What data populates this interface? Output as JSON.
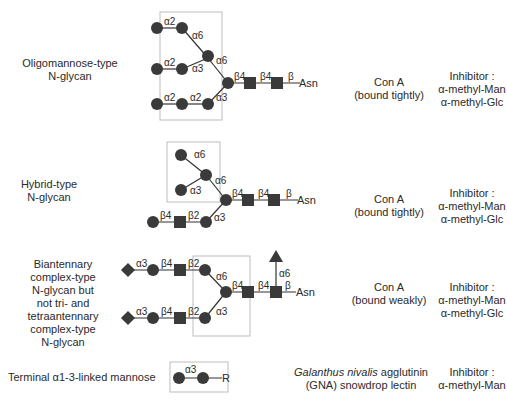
{
  "rows": [
    {
      "name": "oligomannose",
      "glycan_label": [
        "Oligomannose-type",
        "N-glycan"
      ],
      "lectin": [
        "Con A",
        "(bound tightly)"
      ],
      "inhibitor": [
        "Inhibitor :",
        "α-methyl-Man",
        "α-methyl-Glc"
      ],
      "linkages": {
        "a2_top": "α2",
        "a6_top": "α6",
        "a2_mid": "α2",
        "a3_mid": "α3",
        "a6_core": "α6",
        "a2_bot1": "α2",
        "a2_bot2": "α2",
        "a3_core": "α3",
        "b4_1": "β4",
        "b4_2": "β4",
        "b": "β",
        "asn": "Asn"
      }
    },
    {
      "name": "hybrid",
      "glycan_label": [
        "Hybrid-type",
        "N-glycan"
      ],
      "lectin": [
        "Con A",
        "(bound tightly)"
      ],
      "inhibitor": [
        "Inhibitor :",
        "α-methyl-Man",
        "α-methyl-Glc"
      ],
      "linkages": {
        "a6_top": "α6",
        "a3_top": "α3",
        "a6_core": "α6",
        "b4_branch": "β4",
        "b2_branch": "β2",
        "a3_core": "α3",
        "b4_1": "β4",
        "b4_2": "β4",
        "b": "β",
        "asn": "Asn"
      }
    },
    {
      "name": "biantennary",
      "glycan_label": [
        "Biantennary",
        "complex-type",
        "N-glycan but",
        "not tri- and",
        "tetraantennary",
        "complex-type",
        "N-glycan"
      ],
      "lectin": [
        "Con A",
        "(bound weakly)"
      ],
      "inhibitor": [
        "Inhibitor :",
        "α-methyl-Man",
        "α-methyl-Glc"
      ],
      "linkages": {
        "a3_top": "α3",
        "b4_top": "β4",
        "b2_top": "β2",
        "a6_core": "α6",
        "a3_bot": "α3",
        "b4_bot": "β4",
        "b2_bot": "β2",
        "a3_core": "α3",
        "b4_1": "β4",
        "b4_2": "β4",
        "a6_fuc": "α6",
        "b": "β",
        "asn": "Asn"
      }
    },
    {
      "name": "terminal-mannose",
      "glycan_label": [
        "Terminal α1-3-linked mannose"
      ],
      "lectin_italic": "Galanthus nivalis",
      "lectin_rest": " agglutinin",
      "lectin_line2": "(GNA) snowdrop lectin",
      "inhibitor": [
        "Inhibitor :",
        "α-methyl-Man"
      ],
      "linkages": {
        "a3": "α3",
        "r": "R"
      }
    }
  ],
  "colors": {
    "symbol_fill": "#3a3a3a",
    "box_stroke": "#bdbdbd",
    "line": "#333333",
    "text": "#2a2a2a"
  }
}
